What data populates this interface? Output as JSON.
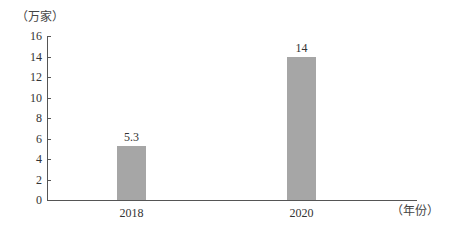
{
  "chart_data": {
    "type": "bar",
    "title": "",
    "categories": [
      "2018",
      "2020"
    ],
    "values": [
      5.3,
      14
    ],
    "data_labels": [
      "5.3",
      "14"
    ],
    "xlabel": "（年份）",
    "ylabel": "（万家）",
    "ylim": [
      0,
      16
    ],
    "yticks": [
      0,
      2,
      4,
      6,
      8,
      10,
      12,
      14,
      16
    ],
    "ytick_labels": [
      "0",
      "2",
      "4",
      "6",
      "8",
      "10",
      "12",
      "14",
      "16"
    ],
    "grid": false,
    "legend": null,
    "bar_color": "#a6a6a6"
  }
}
